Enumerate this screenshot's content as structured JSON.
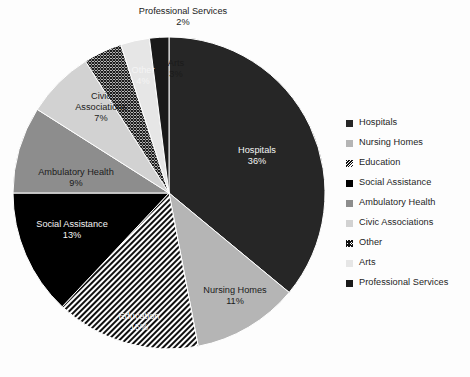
{
  "chart_data": {
    "type": "pie",
    "title": "",
    "subtitle": "",
    "xlabel": "",
    "ylabel": "",
    "legend_position": "right",
    "grid": false,
    "start_angle_deg": 0,
    "direction": "clockwise",
    "units": "percent",
    "categories": [
      "Hospitals",
      "Nursing Homes",
      "Education",
      "Social Assistance",
      "Ambulatory Health",
      "Civic Associations",
      "Other",
      "Arts",
      "Professional Services"
    ],
    "values": [
      36,
      11,
      15,
      13,
      9,
      7,
      4,
      3,
      2
    ],
    "value_labels": [
      "36%",
      "11%",
      "15%",
      "13%",
      "9%",
      "7%",
      "4%",
      "3%",
      "2%"
    ],
    "slices": [
      {
        "name": "Hospitals",
        "value": 36,
        "value_label": "36%",
        "fill": "#262626",
        "pattern": "solid",
        "label_text": "Hospitals",
        "label_color": "light",
        "label_x": 257,
        "label_y": 156,
        "label_placement": "inside"
      },
      {
        "name": "Nursing Homes",
        "value": 11,
        "value_label": "11%",
        "fill": "#b5b5b5",
        "pattern": "solid",
        "label_text": "Nursing Homes",
        "label_color": "dark",
        "label_x": 235,
        "label_y": 296,
        "label_placement": "inside"
      },
      {
        "name": "Education",
        "value": 15,
        "value_label": "15%",
        "fill": "#ffffff",
        "pattern": "diagonal-stripes",
        "label_text": "Education",
        "label_color": "light",
        "label_x": 139,
        "label_y": 322,
        "label_placement": "inside"
      },
      {
        "name": "Social Assistance",
        "value": 13,
        "value_label": "13%",
        "fill": "#000000",
        "pattern": "solid",
        "label_text": "Social Assistance",
        "label_color": "light",
        "label_x": 72,
        "label_y": 230,
        "label_placement": "inside"
      },
      {
        "name": "Ambulatory Health",
        "value": 9,
        "value_label": "9%",
        "fill": "#8d8d8d",
        "pattern": "solid",
        "label_text": "Ambulatory Health",
        "label_color": "dark",
        "label_x": 76,
        "label_y": 178,
        "label_placement": "inside"
      },
      {
        "name": "Civic Associations",
        "value": 7,
        "value_label": "7%",
        "fill": "#d2d2d2",
        "pattern": "solid",
        "label_text": "Civic Associations",
        "label_color": "dark",
        "label_x": 101,
        "label_y": 108,
        "label_placement": "inside",
        "wrap": [
          "Civic",
          "Associations"
        ]
      },
      {
        "name": "Other",
        "value": 4,
        "value_label": "4%",
        "fill": "#ffffff",
        "pattern": "cross-hatch",
        "label_text": "Other",
        "label_color": "light",
        "label_x": 143,
        "label_y": 76,
        "label_placement": "inside"
      },
      {
        "name": "Arts",
        "value": 3,
        "value_label": "3%",
        "fill": "#e6e6e6",
        "pattern": "solid",
        "label_text": "Arts",
        "label_color": "dark",
        "label_x": 176,
        "label_y": 69,
        "label_placement": "inside"
      },
      {
        "name": "Professional Services",
        "value": 2,
        "value_label": "2%",
        "fill": "#1a1a1a",
        "pattern": "solid",
        "label_text": "Professional Services",
        "label_color": "dark",
        "label_x": 183,
        "label_y": 17,
        "label_placement": "outside-top"
      }
    ]
  },
  "callouts": {
    "professional_services_name": "Professional Services",
    "professional_services_pct": "2%",
    "arts_name": "Arts",
    "arts_pct": "3%",
    "other_name": "Other",
    "other_pct": "4%",
    "civic_line1": "Civic",
    "civic_line2": "Associations",
    "civic_pct": "7%",
    "ambulatory_name": "Ambulatory Health",
    "ambulatory_pct": "9%",
    "social_name": "Social Assistance",
    "social_pct": "13%",
    "education_name": "Education",
    "education_pct": "15%",
    "nursing_name": "Nursing Homes",
    "nursing_pct": "11%",
    "hospitals_name": "Hospitals",
    "hospitals_pct": "36%"
  },
  "legend": {
    "position": "right",
    "items": [
      {
        "label": "Hospitals",
        "swatch": "#262626",
        "pattern": "solid"
      },
      {
        "label": "Nursing Homes",
        "swatch": "#b5b5b5",
        "pattern": "solid"
      },
      {
        "label": "Education",
        "swatch": "#ffffff",
        "pattern": "diagonal-stripes"
      },
      {
        "label": "Social Assistance",
        "swatch": "#000000",
        "pattern": "solid"
      },
      {
        "label": "Ambulatory Health",
        "swatch": "#8d8d8d",
        "pattern": "solid"
      },
      {
        "label": "Civic Associations",
        "swatch": "#d2d2d2",
        "pattern": "solid"
      },
      {
        "label": "Other",
        "swatch": "#ffffff",
        "pattern": "cross-hatch"
      },
      {
        "label": "Arts",
        "swatch": "#e6e6e6",
        "pattern": "solid"
      },
      {
        "label": "Professional Services",
        "swatch": "#1a1a1a",
        "pattern": "solid"
      }
    ]
  },
  "geometry": {
    "center_x": 169,
    "center_y": 193,
    "radius": 156
  }
}
